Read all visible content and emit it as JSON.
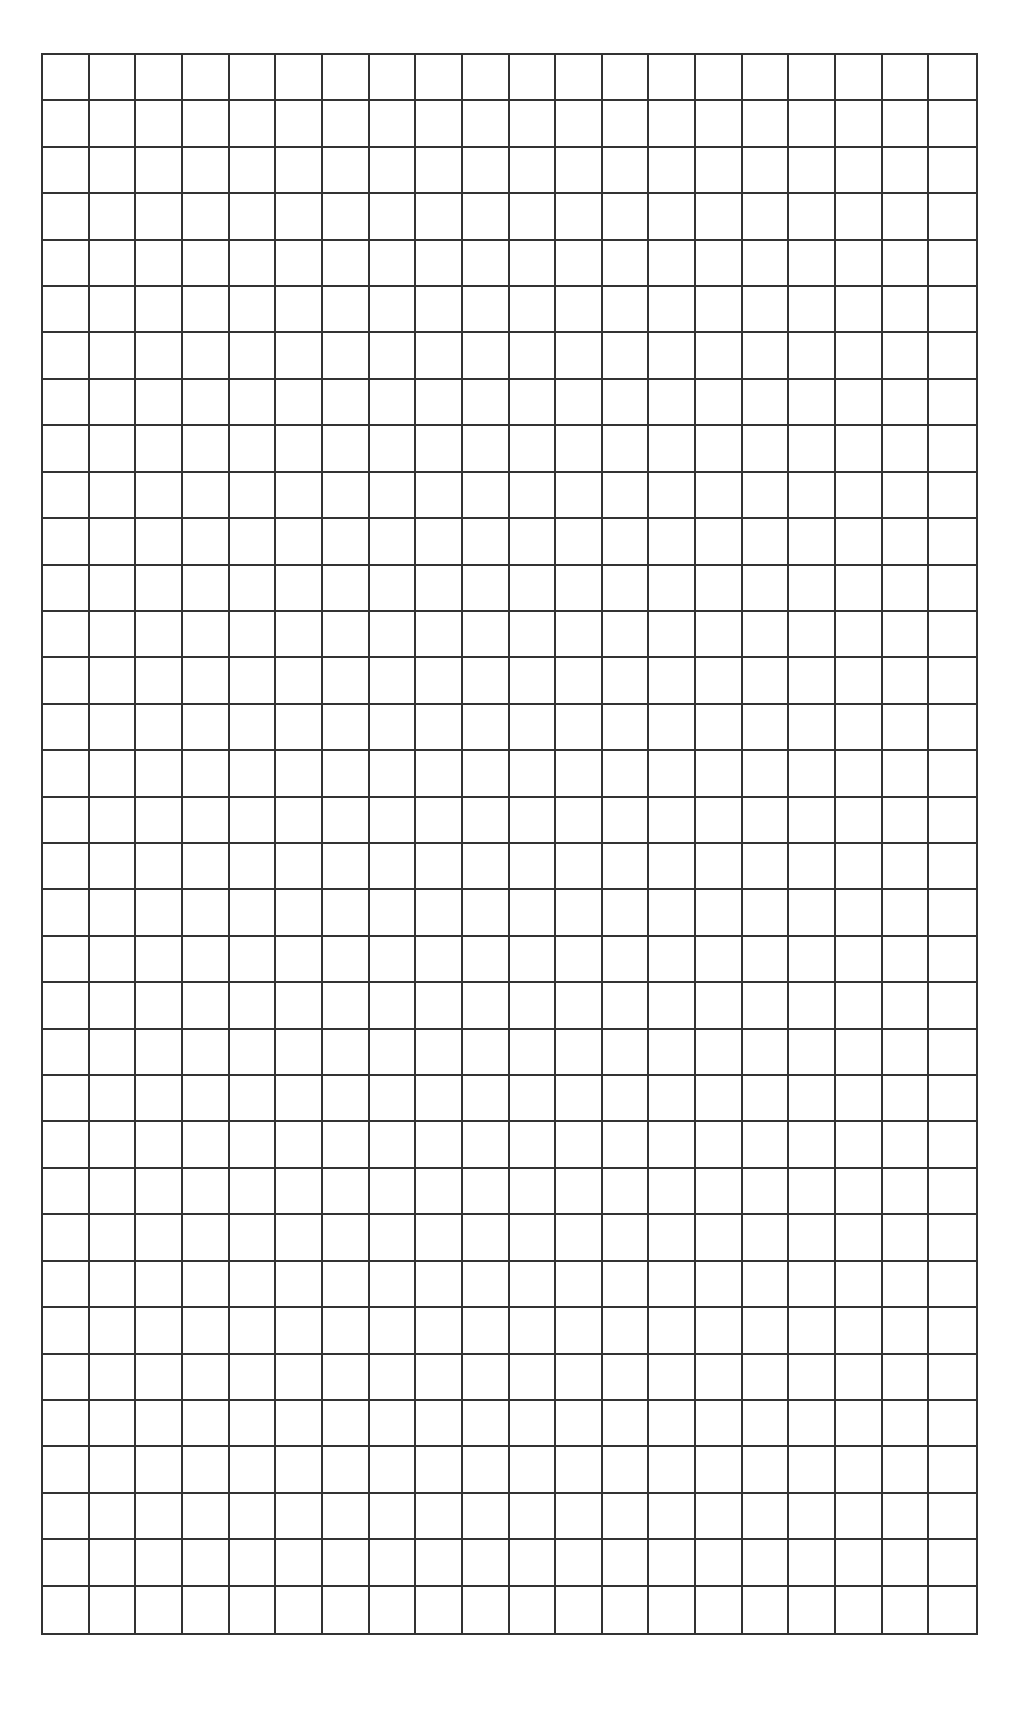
{
  "page": {
    "background": "#ffffff",
    "width": 1022,
    "height": 1725
  },
  "grid": {
    "description": "Blank square graph-paper grid",
    "columns": 20,
    "rows": 34,
    "left": 41,
    "top": 53,
    "width": 937,
    "height": 1582,
    "line_color": "#333333",
    "line_width": 2
  }
}
